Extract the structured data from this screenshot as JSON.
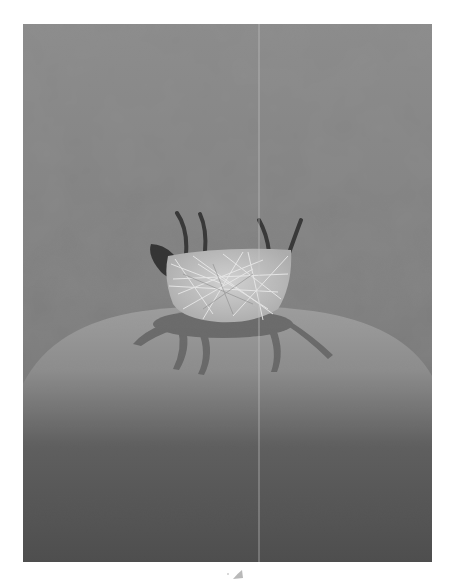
{
  "illustration": {
    "subject": "upside-down straw sheep on a hill",
    "palette": {
      "background_top": "#8a8a8a",
      "background_mid": "#7c7c7c",
      "hill_light": "#9a9a9a",
      "hill_dark": "#4e4e4e",
      "nest_fill": "#e6e6e6",
      "nest_strands": "#f4f4f4",
      "legs": "#3a3a3a",
      "shadow": "#5e5e5e",
      "fold_line": "#c8c8c8"
    }
  }
}
